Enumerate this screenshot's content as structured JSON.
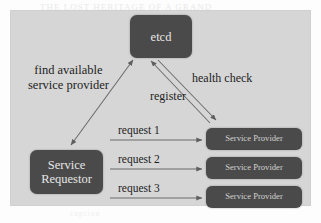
{
  "page": {
    "ghost_text_top": "THE LOST HERITAGE OF A GRAND",
    "ghost_text_mid1": "THE MOST REMARKABLE CONTENT",
    "ghost_text_mid2": "A BRIEF NOTE ON THE ARCHIVE",
    "ghost_text_bottom": "caption"
  },
  "diagram": {
    "type": "service-discovery-architecture",
    "nodes": [
      {
        "id": "etcd",
        "label": "etcd"
      },
      {
        "id": "requestor",
        "label": "Service\nRequestor",
        "line1": "Service",
        "line2": "Requestor"
      },
      {
        "id": "provider1",
        "label": "Service Provider"
      },
      {
        "id": "provider2",
        "label": "Service Provider"
      },
      {
        "id": "provider3",
        "label": "Service Provider"
      }
    ],
    "edge_labels": {
      "find_line1": "find available",
      "find_line2": "service provider",
      "health_check": "health check",
      "register": "register",
      "request_1": "request 1",
      "request_2": "request 2",
      "request_3": "request 3"
    },
    "colors": {
      "panel_background": "#d6d6d6",
      "node_fill": "#4a4a4a",
      "node_text": "#e6e6e6",
      "edge_stroke": "#6b6b6b",
      "label_text": "#1d1d1d"
    }
  }
}
